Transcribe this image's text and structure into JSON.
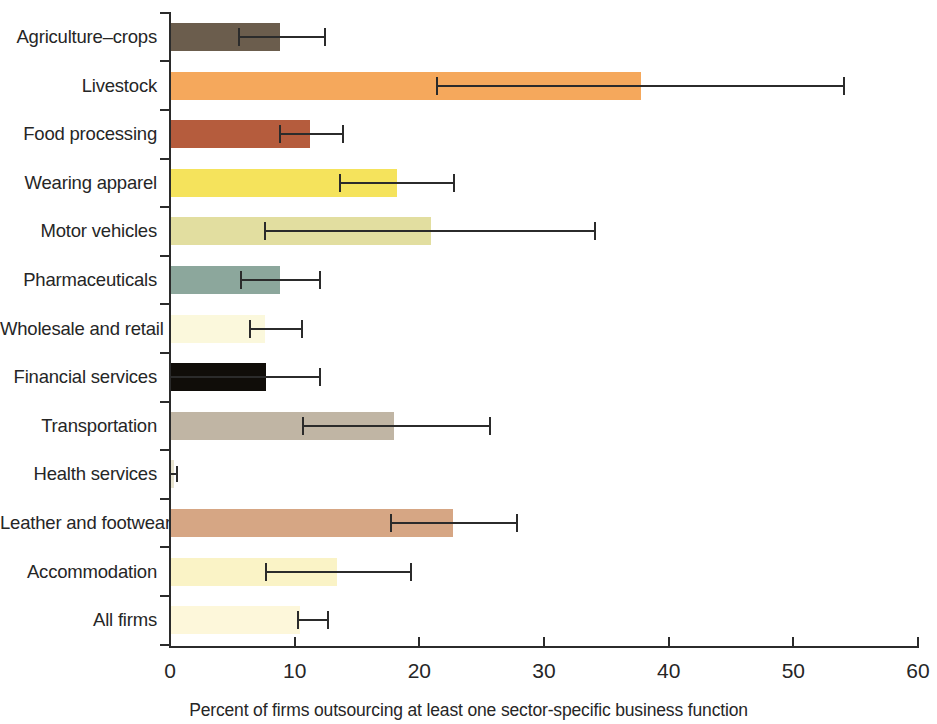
{
  "chart_data": {
    "type": "bar",
    "orientation": "horizontal",
    "title": "",
    "subtitle": "",
    "xlabel": "Percent of firms outsourcing at least one sector-specific business function",
    "ylabel": "",
    "xlim": [
      0,
      60
    ],
    "xticks": [
      0,
      10,
      20,
      30,
      40,
      50,
      60
    ],
    "xticklabels": [
      "0",
      "10",
      "20",
      "30",
      "40",
      "50",
      "60"
    ],
    "grid": false,
    "legend": "none",
    "error_bars": "horizontal whisker with caps (confidence interval)",
    "categories": [
      "Agriculture–crops",
      "Livestock",
      "Food processing",
      "Wearing apparel",
      "Motor vehicles",
      "Pharmaceuticals",
      "Wholesale and retail",
      "Financial services",
      "Transportation",
      "Health services",
      "Leather and footwear",
      "Accommodation",
      "All firms"
    ],
    "values": [
      8.8,
      37.8,
      11.2,
      18.2,
      20.9,
      8.8,
      7.6,
      7.7,
      18.0,
      0.3,
      22.7,
      13.4,
      10.4
    ],
    "ci_low": [
      5.5,
      21.4,
      8.8,
      13.6,
      7.6,
      5.7,
      6.4,
      0.0,
      10.7,
      0.0,
      17.7,
      7.7,
      10.3
    ],
    "ci_high": [
      12.4,
      54.1,
      13.9,
      22.8,
      34.1,
      12.0,
      10.6,
      12.0,
      25.7,
      0.6,
      27.8,
      19.3,
      12.7
    ],
    "bar_colors": [
      "#6b5d4d",
      "#f5a85c",
      "#b55c3d",
      "#f5e35c",
      "#e2dea0",
      "#8ca79c",
      "#fbf8dc",
      "#100d09",
      "#c0b5a4",
      "#e8e4d0",
      "#d6a684",
      "#faf3c6",
      "#fdf7da"
    ]
  },
  "axis": {
    "tick_color": "#2b2b2b",
    "error_color": "#2b2b2b"
  }
}
